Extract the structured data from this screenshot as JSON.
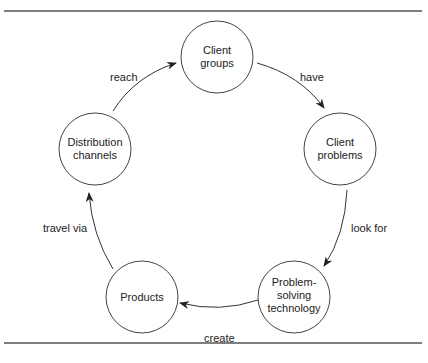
{
  "diagram": {
    "nodes": [
      {
        "id": "client-groups",
        "lines": [
          "Client",
          "groups"
        ]
      },
      {
        "id": "client-problems",
        "lines": [
          "Client",
          "problems"
        ]
      },
      {
        "id": "problem-solving-technology",
        "lines": [
          "Problem-",
          "solving",
          "technology"
        ]
      },
      {
        "id": "products",
        "lines": [
          "Products"
        ]
      },
      {
        "id": "distribution-channels",
        "lines": [
          "Distribution",
          "channels"
        ]
      }
    ],
    "edges": [
      {
        "from": "client-groups",
        "to": "client-problems",
        "label": "have"
      },
      {
        "from": "client-problems",
        "to": "problem-solving-technology",
        "label": "look for"
      },
      {
        "from": "problem-solving-technology",
        "to": "products",
        "label": "create"
      },
      {
        "from": "products",
        "to": "distribution-channels",
        "label": "travel via"
      },
      {
        "from": "distribution-channels",
        "to": "client-groups",
        "label": "reach"
      }
    ]
  }
}
